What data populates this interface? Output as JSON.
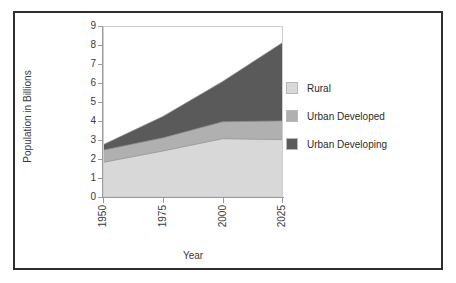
{
  "chart_data": {
    "type": "area",
    "stacked": true,
    "title": "",
    "xlabel": "Year",
    "ylabel": "Population in Billions",
    "x": [
      1950,
      1975,
      2000,
      2025
    ],
    "xtick_labels": [
      "1950",
      "1975",
      "2000",
      "2025"
    ],
    "ytick_labels": [
      "0",
      "1",
      "2",
      "3",
      "4",
      "5",
      "6",
      "7",
      "8",
      "9"
    ],
    "xlim": [
      1950,
      2025
    ],
    "ylim": [
      0,
      9
    ],
    "grid": false,
    "legend_position": "right",
    "series": [
      {
        "name": "Rural",
        "color": "#d8d8d8",
        "values": [
          1.8,
          2.4,
          3.05,
          3.0
        ],
        "cumulative": [
          1.8,
          2.4,
          3.05,
          3.0
        ]
      },
      {
        "name": "Urban Developed",
        "color": "#b0b0b0",
        "values": [
          0.65,
          0.7,
          0.9,
          1.0
        ],
        "cumulative": [
          2.45,
          3.1,
          3.95,
          4.0
        ]
      },
      {
        "name": "Urban Developing",
        "color": "#5a5a5a",
        "values": [
          0.3,
          1.15,
          2.15,
          4.15
        ],
        "cumulative": [
          2.75,
          4.25,
          6.1,
          8.15
        ]
      }
    ]
  },
  "legend": {
    "items": [
      {
        "label": "Rural",
        "color": "#d8d8d8"
      },
      {
        "label": "Urban Developed",
        "color": "#b0b0b0"
      },
      {
        "label": "Urban Developing",
        "color": "#5a5a5a"
      }
    ]
  },
  "axes": {
    "y_title": "Population in Billions",
    "x_title": "Year"
  }
}
